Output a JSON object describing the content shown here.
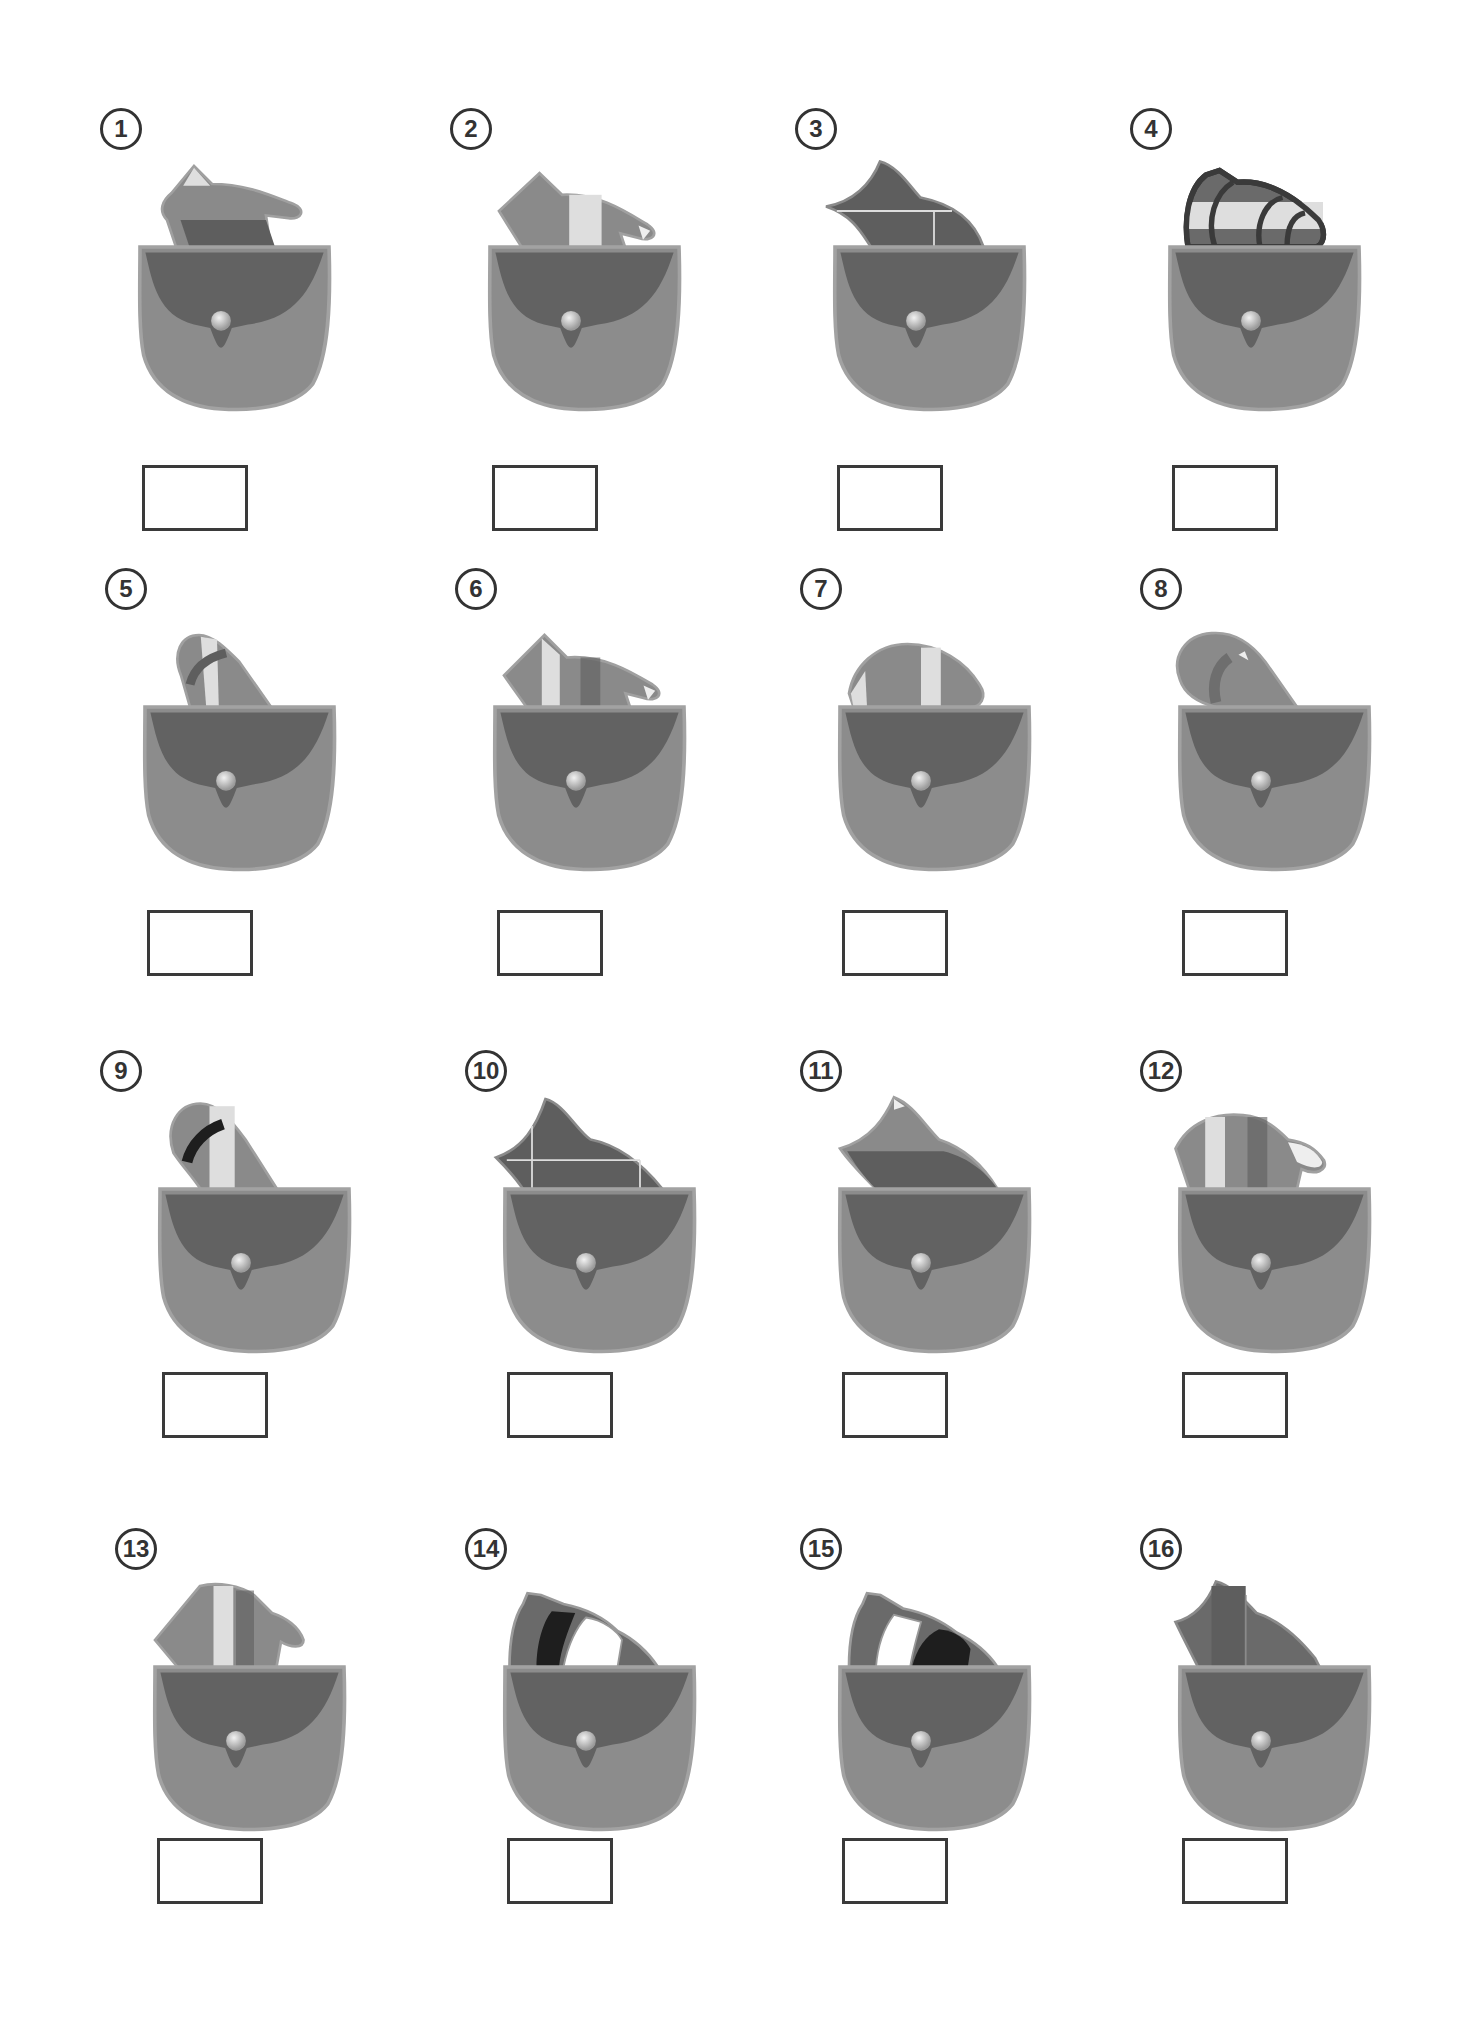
{
  "worksheet": {
    "colors": {
      "pocket_body": "#8c8c8c",
      "pocket_outline": "#9e9e9e",
      "pocket_flap": "#626262",
      "button": "#c8c8c8",
      "glove_mid": "#8a8a8a",
      "glove_dark": "#5e5e5e",
      "glove_light": "#dedede",
      "glove_black": "#1e1e1e",
      "answer_box_border": "#3a3a3a"
    },
    "items": [
      {
        "number": "1",
        "glove": "mitt-light-tip",
        "answer": ""
      },
      {
        "number": "2",
        "glove": "glove-white-stripe",
        "answer": ""
      },
      {
        "number": "3",
        "glove": "dark-glove-lines",
        "answer": ""
      },
      {
        "number": "4",
        "glove": "outlined-striped-glove",
        "answer": ""
      },
      {
        "number": "5",
        "glove": "sock-band-light",
        "answer": ""
      },
      {
        "number": "6",
        "glove": "glove-white-stripe-b",
        "answer": ""
      },
      {
        "number": "7",
        "glove": "glove-rounded-stripe",
        "answer": ""
      },
      {
        "number": "8",
        "glove": "sock-plain-band",
        "answer": ""
      },
      {
        "number": "9",
        "glove": "sock-black-band",
        "answer": ""
      },
      {
        "number": "10",
        "glove": "dark-glove-lines-b",
        "answer": ""
      },
      {
        "number": "11",
        "glove": "dark-glove-light-tip",
        "answer": ""
      },
      {
        "number": "12",
        "glove": "mitt-white-stripe",
        "answer": ""
      },
      {
        "number": "13",
        "glove": "mitt-white-stripe-b",
        "answer": ""
      },
      {
        "number": "14",
        "glove": "glove-black-white-1",
        "answer": ""
      },
      {
        "number": "15",
        "glove": "glove-black-white-2",
        "answer": ""
      },
      {
        "number": "16",
        "glove": "dark-glove-vertical",
        "answer": ""
      }
    ]
  }
}
